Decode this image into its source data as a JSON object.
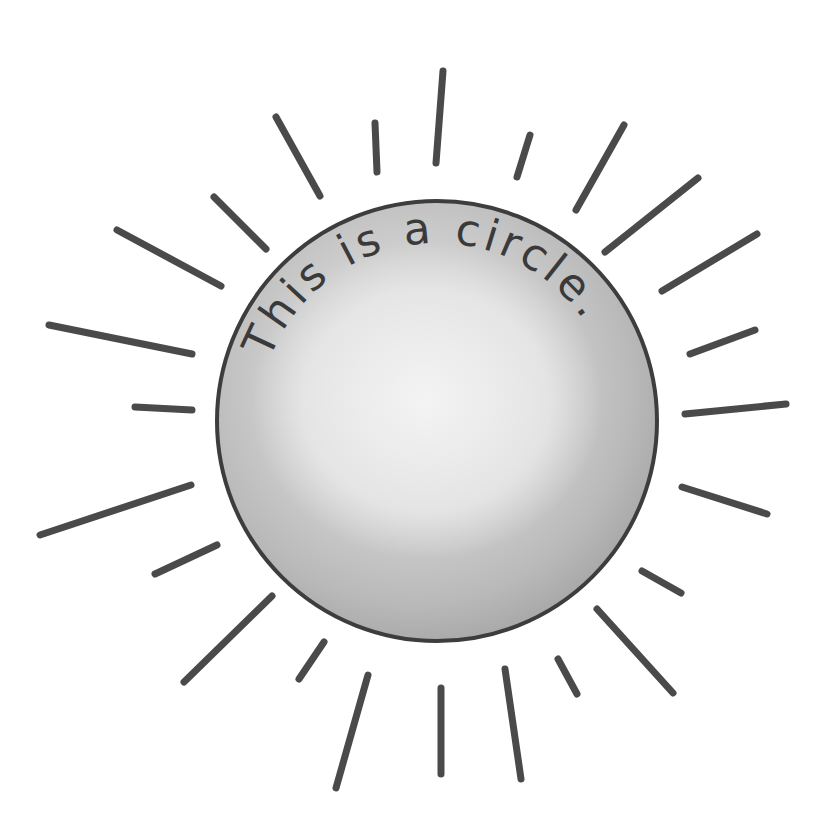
{
  "illustration": {
    "title": "sun-circle-illustration",
    "caption": "This is a circle.",
    "canvas": {
      "width": 816,
      "height": 827
    },
    "colors": {
      "background": "#ffffff",
      "ray": "#4a4a4a",
      "outline": "#3d3d3d",
      "rim": "#a6a6a6",
      "highlight": "#ececec",
      "body_mid": "#cfcfcf",
      "body_low": "#b2b2b2",
      "text": "#3a3a3a"
    },
    "circle": {
      "cx": 437,
      "cy": 421,
      "r": 220
    },
    "text_arc": {
      "radius": 178,
      "start_deg": 200,
      "end_deg": 352
    },
    "rays": [
      {
        "x1": 276,
        "y1": 117,
        "x2": 320,
        "y2": 196
      },
      {
        "x1": 375,
        "y1": 123,
        "x2": 377,
        "y2": 172
      },
      {
        "x1": 214,
        "y1": 197,
        "x2": 266,
        "y2": 249
      },
      {
        "x1": 117,
        "y1": 230,
        "x2": 221,
        "y2": 286
      },
      {
        "x1": 49,
        "y1": 325,
        "x2": 192,
        "y2": 354
      },
      {
        "x1": 135,
        "y1": 407,
        "x2": 192,
        "y2": 410
      },
      {
        "x1": 443,
        "y1": 71,
        "x2": 436,
        "y2": 163
      },
      {
        "x1": 530,
        "y1": 135,
        "x2": 517,
        "y2": 177
      },
      {
        "x1": 624,
        "y1": 125,
        "x2": 576,
        "y2": 210
      },
      {
        "x1": 698,
        "y1": 178,
        "x2": 605,
        "y2": 252
      },
      {
        "x1": 757,
        "y1": 234,
        "x2": 662,
        "y2": 291
      },
      {
        "x1": 755,
        "y1": 330,
        "x2": 690,
        "y2": 354
      },
      {
        "x1": 786,
        "y1": 404,
        "x2": 685,
        "y2": 414
      },
      {
        "x1": 191,
        "y1": 485,
        "x2": 40,
        "y2": 535
      },
      {
        "x1": 217,
        "y1": 545,
        "x2": 155,
        "y2": 574
      },
      {
        "x1": 272,
        "y1": 596,
        "x2": 184,
        "y2": 682
      },
      {
        "x1": 324,
        "y1": 642,
        "x2": 299,
        "y2": 679
      },
      {
        "x1": 368,
        "y1": 675,
        "x2": 336,
        "y2": 788
      },
      {
        "x1": 682,
        "y1": 487,
        "x2": 767,
        "y2": 514
      },
      {
        "x1": 642,
        "y1": 571,
        "x2": 681,
        "y2": 593
      },
      {
        "x1": 597,
        "y1": 609,
        "x2": 673,
        "y2": 693
      },
      {
        "x1": 558,
        "y1": 659,
        "x2": 577,
        "y2": 694
      },
      {
        "x1": 505,
        "y1": 669,
        "x2": 521,
        "y2": 779
      },
      {
        "x1": 441,
        "y1": 688,
        "x2": 441,
        "y2": 774
      }
    ]
  }
}
